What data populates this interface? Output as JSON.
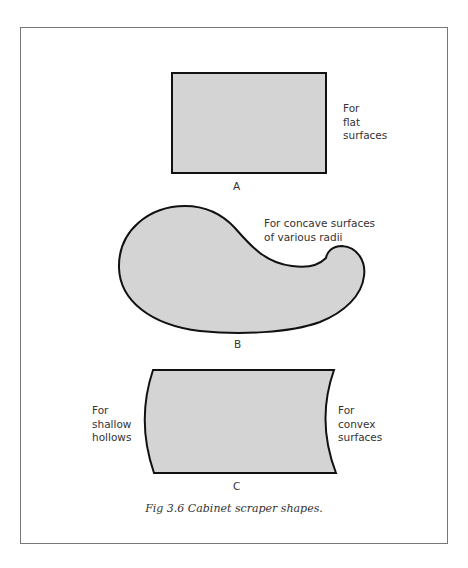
{
  "figure": {
    "caption": "Fig 3.6  Cabinet scraper shapes.",
    "fill_color": "#d4d4d4",
    "stroke_color": "#111111",
    "frame_color": "#777777"
  },
  "shapes": [
    {
      "id": "A",
      "letter": "A",
      "kind": "rectangle",
      "label": "For\nflat\nsurfaces"
    },
    {
      "id": "B",
      "letter": "B",
      "kind": "gooseneck",
      "label": "For concave surfaces\nof various radii"
    },
    {
      "id": "C",
      "letter": "C",
      "kind": "curved-edge",
      "label_left": "For\nshallow\nhollows",
      "label_right": "For\nconvex\nsurfaces"
    }
  ]
}
